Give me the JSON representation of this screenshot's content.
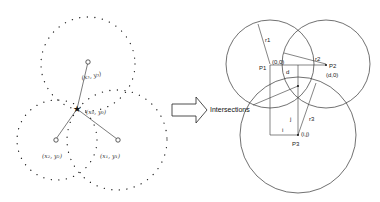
{
  "left_diagram": {
    "anchors": [
      {
        "label": "(x₃, y₃)"
      },
      {
        "label": "(x₂, y₂)"
      },
      {
        "label": "(x₁, y₁)"
      }
    ],
    "estimate_label": "(x₀, y₀)"
  },
  "arrow": {
    "label": "Intersections"
  },
  "right_diagram": {
    "circles": [
      {
        "point": "P1",
        "radius_label": "r1",
        "coord": "(0,0)"
      },
      {
        "point": "P2",
        "radius_label": "r2",
        "coord": "(d,0)"
      },
      {
        "point": "P3",
        "radius_label": "r3",
        "coord": "(i,j)"
      }
    ],
    "d_label": "d",
    "i_label": "i",
    "j_label": "j"
  }
}
